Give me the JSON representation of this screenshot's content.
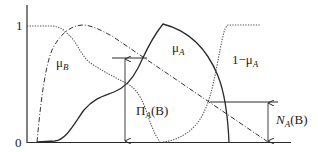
{
  "diagram": {
    "axis": {
      "y_tick_top": "1",
      "y_tick_bottom": "0"
    },
    "curves": [
      {
        "id": "mu_B",
        "label_main": "μ",
        "label_sub": "B",
        "style": "dotted"
      },
      {
        "id": "mu_A",
        "label_main": "μ",
        "label_sub": "A",
        "style": "solid"
      },
      {
        "id": "one_minus_mu_A",
        "label_prefix": "1−μ",
        "label_sub": "A",
        "style": "dotted"
      },
      {
        "id": "min_curve",
        "style": "dash-dot"
      }
    ],
    "measures": {
      "possibility": {
        "symbol": "Π",
        "sub": "A",
        "arg": "(B)"
      },
      "necessity": {
        "symbol": "N",
        "sub": "A",
        "arg": "(B)"
      }
    },
    "colors": {
      "line": "#2a2a2a",
      "dotted": "#555555",
      "background": "#ffffff"
    }
  }
}
